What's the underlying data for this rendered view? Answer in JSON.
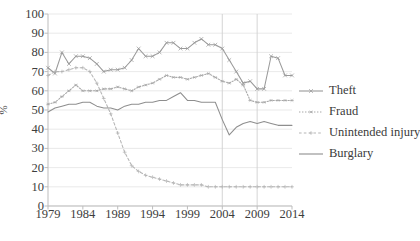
{
  "chart_data": {
    "type": "line",
    "title": "",
    "subtitle": "",
    "xlabel": "",
    "ylabel": "%",
    "xlim": [
      1979,
      2014
    ],
    "ylim": [
      0,
      100
    ],
    "grid": "horizontal-and-selected-vertical",
    "legend_position": "right",
    "x": [
      1979,
      1980,
      1981,
      1982,
      1983,
      1984,
      1985,
      1986,
      1987,
      1988,
      1989,
      1990,
      1991,
      1992,
      1993,
      1994,
      1995,
      1996,
      1997,
      1998,
      1999,
      2000,
      2001,
      2002,
      2003,
      2004,
      2005,
      2006,
      2007,
      2008,
      2009,
      2010,
      2011,
      2012,
      2013,
      2014
    ],
    "x_tick_labels": [
      "1979",
      "1984",
      "1989",
      "1994",
      "1999",
      "2004",
      "2009",
      "2014"
    ],
    "x_ticks": [
      1979,
      1984,
      1989,
      1994,
      1999,
      2004,
      2009,
      2014
    ],
    "y_tick_labels": [
      "0",
      "10",
      "20",
      "30",
      "40",
      "50",
      "60",
      "70",
      "80",
      "90",
      "100"
    ],
    "y_ticks": [
      0,
      10,
      20,
      30,
      40,
      50,
      60,
      70,
      80,
      90,
      100
    ],
    "vertical_gridlines": [
      2004,
      2009
    ],
    "series": [
      {
        "name": "Theft",
        "marker": "x",
        "line_style": "solid",
        "color": "#9a9a9a",
        "values": [
          72,
          69,
          80,
          74,
          78,
          78,
          77,
          74,
          70,
          71,
          71,
          72,
          76,
          82,
          78,
          78,
          80,
          85,
          85,
          82,
          82,
          85,
          87,
          84,
          84,
          82,
          76,
          70,
          64,
          65,
          61,
          61,
          78,
          77,
          68,
          68
        ]
      },
      {
        "name": "Fraud",
        "marker": "asterisk",
        "line_style": "dotted",
        "color": "#a7a7a7",
        "values": [
          53,
          54,
          57,
          60,
          63,
          60,
          60,
          60,
          61,
          61,
          62,
          61,
          60,
          62,
          63,
          64,
          66,
          68,
          67,
          67,
          66,
          67,
          68,
          69,
          67,
          65,
          64,
          66,
          63,
          55,
          54,
          54,
          55,
          55,
          55,
          55
        ]
      },
      {
        "name": "Unintended injury",
        "marker": "plus",
        "line_style": "dashed",
        "color": "#b5b5b5",
        "values": [
          68,
          70,
          70,
          71,
          72,
          72,
          70,
          64,
          56,
          48,
          38,
          28,
          21,
          18,
          16,
          15,
          14,
          13,
          12,
          11,
          11,
          11,
          11,
          10,
          10,
          10,
          10,
          10,
          10,
          10,
          10,
          10,
          10,
          10,
          10,
          10
        ]
      },
      {
        "name": "Burglary",
        "marker": "none",
        "line_style": "solid",
        "color": "#8e8e8e",
        "values": [
          49,
          51,
          52,
          53,
          53,
          54,
          54,
          52,
          51,
          51,
          50,
          52,
          53,
          53,
          54,
          54,
          55,
          55,
          57,
          59,
          55,
          55,
          54,
          54,
          54,
          45,
          37,
          41,
          43,
          44,
          43,
          44,
          43,
          42,
          42,
          42
        ]
      }
    ]
  },
  "legend": {
    "items": [
      {
        "label": "Theft"
      },
      {
        "label": "Fraud"
      },
      {
        "label": "Unintended injury"
      },
      {
        "label": "Burglary"
      }
    ]
  }
}
